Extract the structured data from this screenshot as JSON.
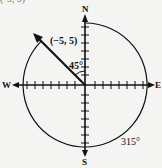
{
  "figure": {
    "top_cut_text": "(-5, 5)",
    "compass": {
      "north": "N",
      "south": "S",
      "east": "E",
      "west": "W"
    },
    "vector_label": "(−5, 5)",
    "angle_label": "45°",
    "arc_label": "315°",
    "ticks_per_half_axis": 7,
    "colors": {
      "ink": "#111111",
      "background": "#f4f4f2"
    }
  }
}
